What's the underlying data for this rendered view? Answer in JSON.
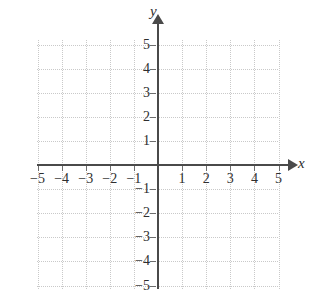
{
  "chart_data": {
    "type": "scatter",
    "title": "",
    "xlabel": "x",
    "ylabel": "y",
    "xlim": [
      -5,
      5
    ],
    "ylim": [
      -5,
      5
    ],
    "grid": true,
    "legend": null,
    "series": [],
    "x_ticks": [
      -5,
      -4,
      -3,
      -2,
      -1,
      1,
      2,
      3,
      4,
      5
    ],
    "y_ticks": [
      5,
      4,
      3,
      2,
      1,
      -1,
      -2,
      -3,
      -4,
      -5
    ],
    "x_tick_labels": [
      "−5",
      "−4",
      "−3",
      "−2",
      "−1",
      "1",
      "2",
      "3",
      "4",
      "5"
    ],
    "y_tick_labels": [
      "5",
      "4",
      "3",
      "2",
      "1",
      "−1",
      "−2",
      "−3",
      "−4",
      "−5"
    ],
    "annotations": []
  },
  "axes": {
    "x_label": "x",
    "y_label": "y"
  },
  "x_labels": [
    {
      "value": -5,
      "text": "−5"
    },
    {
      "value": -4,
      "text": "−4"
    },
    {
      "value": -3,
      "text": "−3"
    },
    {
      "value": -2,
      "text": "−2"
    },
    {
      "value": -1,
      "text": "−1"
    },
    {
      "value": 1,
      "text": "1"
    },
    {
      "value": 2,
      "text": "2"
    },
    {
      "value": 3,
      "text": "3"
    },
    {
      "value": 4,
      "text": "4"
    },
    {
      "value": 5,
      "text": "5"
    }
  ],
  "y_labels": [
    {
      "value": 5,
      "text": "5"
    },
    {
      "value": 4,
      "text": "4"
    },
    {
      "value": 3,
      "text": "3"
    },
    {
      "value": 2,
      "text": "2"
    },
    {
      "value": 1,
      "text": "1"
    },
    {
      "value": -1,
      "text": "−1"
    },
    {
      "value": -2,
      "text": "−2"
    },
    {
      "value": -3,
      "text": "−3"
    },
    {
      "value": -4,
      "text": "−4"
    },
    {
      "value": -5,
      "text": "−5"
    }
  ],
  "colors": {
    "axis": "#4a4a4a",
    "grid": "#c9c9c9",
    "text": "#2e2e2e",
    "background": "#ffffff"
  }
}
